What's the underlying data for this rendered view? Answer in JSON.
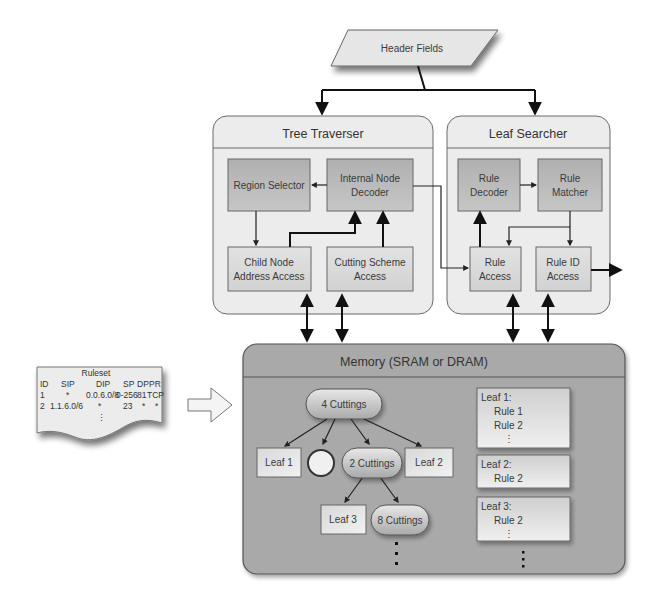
{
  "header_fields": {
    "label": "Header Fields"
  },
  "tree_traverser": {
    "title": "Tree Traverser",
    "blocks": {
      "region_selector": "Region Selector",
      "internal_node_decoder": [
        "Internal Node",
        "Decoder"
      ],
      "child_node_address_access": [
        "Child Node",
        "Address Access"
      ],
      "cutting_scheme_access": [
        "Cutting Scheme",
        "Access"
      ]
    }
  },
  "leaf_searcher": {
    "title": "Leaf Searcher",
    "blocks": {
      "rule_decoder": [
        "Rule",
        "Decoder"
      ],
      "rule_matcher": [
        "Rule",
        "Matcher"
      ],
      "rule_access": [
        "Rule",
        "Access"
      ],
      "rule_id_access": [
        "Rule ID",
        "Access"
      ]
    }
  },
  "memory": {
    "title": "Memory (SRAM or DRAM)",
    "tree": {
      "root": "4 Cuttings",
      "level1": [
        "Leaf 1",
        "",
        "2 Cuttings",
        "Leaf 2"
      ],
      "level2": [
        "Leaf 3",
        "8 Cuttings"
      ]
    },
    "leaves": [
      {
        "title": "Leaf 1:",
        "rules": [
          "Rule 1",
          "Rule 2"
        ],
        "more": "⋮"
      },
      {
        "title": "Leaf 2:",
        "rules": [
          "Rule 2"
        ],
        "more": ""
      },
      {
        "title": "Leaf 3:",
        "rules": [
          "Rule 2"
        ],
        "more": "⋮"
      }
    ]
  },
  "ruleset": {
    "title": "Ruleset",
    "columns": [
      "ID",
      "SIP",
      "DIP",
      "SP",
      "DP",
      "PR"
    ],
    "rows": [
      [
        "1",
        "*",
        "0.0.6.0/8",
        "0-256",
        "81",
        "TCP"
      ],
      [
        "2",
        "1.1.6.0/6",
        "*",
        "23",
        "*",
        "*"
      ]
    ],
    "more": "⋮"
  },
  "colors": {
    "panel_fill": "#ebebeb",
    "block_fill": "#b9b9b9",
    "memory_fill": "#a8a8a8",
    "node_fill": "#d2d2d2",
    "leaf_box_fill": "#e4e4e4",
    "stroke": "#555555",
    "arrow": "#111111"
  }
}
